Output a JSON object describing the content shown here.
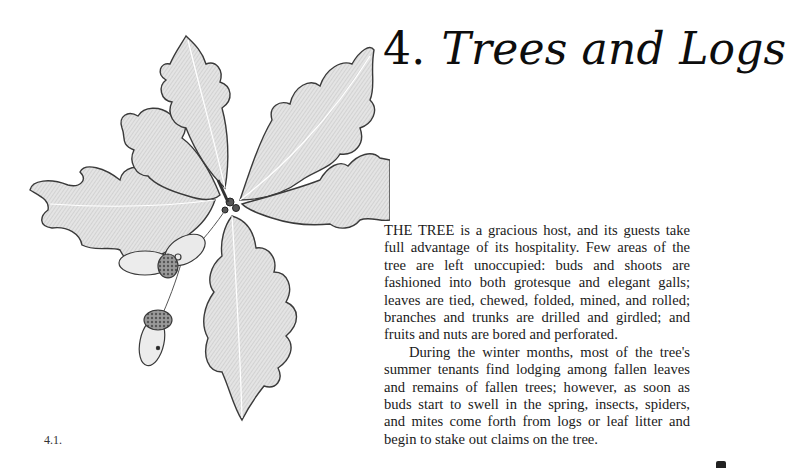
{
  "chapter": {
    "number": "4.",
    "title": "Trees and Logs"
  },
  "paragraphs": [
    "THE TREE is a gracious host, and its guests take full advantage of its hospitality. Few areas of the tree are left unoccupied: buds and shoots are fashioned into both grotesque and elegant galls; leaves are tied, chewed, folded, mined, and rolled; branches and trunks are drilled and girdled; and fruits and nuts are bored and perforated.",
    "During the winter months, most of the tree's summer tenants find lodging among fallen leaves and remains of fallen trees; however, as soon as buds start to swell in the spring, insects, spiders, and mites come forth from logs or leaf litter and begin to stake out claims on the tree."
  ],
  "figure": {
    "caption": "4.1."
  },
  "colors": {
    "ink": "#111111",
    "paper": "#ffffff",
    "leaf_fill": "#d9d9d9",
    "leaf_stroke": "#3a3a3a"
  }
}
